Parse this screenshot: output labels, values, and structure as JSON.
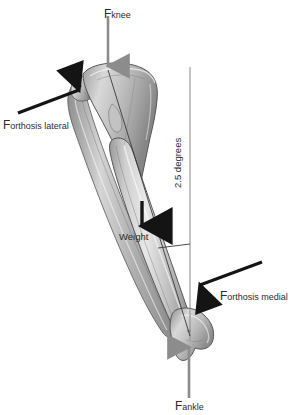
{
  "figure": {
    "background_color": "#ffffff"
  },
  "colors": {
    "gray_arrow": "#8c8c8c",
    "black_arrow": "#141414",
    "axis_line": "#3a3a3a",
    "reference_line": "#8a8a8a",
    "text": "#2b2b2b",
    "bone_light": "#e6e6e6",
    "bone_mid": "#b4b4b4",
    "bone_dark": "#8a8a8a",
    "bone_outline": "#5a5a5a"
  },
  "labels": {
    "f_knee": {
      "base": "F",
      "sub": "knee"
    },
    "f_orthosis_lateral": {
      "base": "F",
      "sub": "orthosis lateral"
    },
    "f_orthosis_medial": {
      "base": "F",
      "sub": "orthosis medial"
    },
    "f_ankle": {
      "base": "F",
      "sub": "ankle"
    },
    "weight": "Weight",
    "angle": "2.5 degrees"
  },
  "annotations": {
    "angle_value": 2.5,
    "angle_units": "degrees"
  },
  "arrows": [
    {
      "name": "f-knee-arrow",
      "color": "#8c8c8c",
      "direction": "down",
      "from": [
        108,
        16
      ],
      "to": [
        108,
        72
      ]
    },
    {
      "name": "f-orthosis-lateral-arrow",
      "color": "#141414",
      "direction": "up-right",
      "from": [
        18,
        112
      ],
      "to": [
        84,
        88
      ]
    },
    {
      "name": "weight-arrow",
      "color": "#141414",
      "direction": "down",
      "from": [
        142,
        200
      ],
      "to": [
        142,
        232
      ]
    },
    {
      "name": "f-orthosis-medial-arrow",
      "color": "#141414",
      "direction": "down-left",
      "from": [
        262,
        262
      ],
      "to": [
        196,
        287
      ]
    },
    {
      "name": "f-ankle-arrow",
      "color": "#8c8c8c",
      "direction": "up",
      "from": [
        189,
        398
      ],
      "to": [
        189,
        341
      ]
    }
  ],
  "lines": [
    {
      "name": "vertical-reference-line",
      "from": [
        190,
        67
      ],
      "to": [
        190,
        340
      ],
      "color": "#8a8a8a"
    },
    {
      "name": "mechanical-axis-line",
      "from": [
        108,
        70
      ],
      "to": [
        190,
        336
      ],
      "color": "#3a3a3a"
    },
    {
      "name": "angle-tick-line",
      "from": [
        160,
        247
      ],
      "to": [
        190,
        244
      ],
      "color": "#3a3a3a"
    }
  ],
  "bones": [
    {
      "name": "tibia",
      "description": "Tibia, proximal plateau upper-left to distal medial malleolus lower-right"
    },
    {
      "name": "fibula",
      "description": "Fibula, slender lateral bone parallel to tibia"
    }
  ]
}
